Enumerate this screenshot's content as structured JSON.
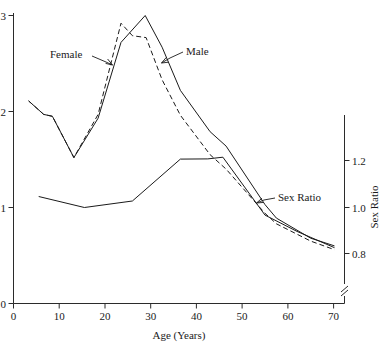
{
  "chart_data": {
    "type": "line",
    "title": "",
    "xlabel": "Age (Years)",
    "ylabel": "",
    "y2label": "Sex Ratio",
    "xlim": [
      0,
      73
    ],
    "ylim": [
      0,
      3.1
    ],
    "y2lim": [
      0.72,
      1.29
    ],
    "xticks": [
      0,
      10,
      20,
      30,
      40,
      50,
      60,
      70
    ],
    "xticklabels": [
      "0",
      "10",
      "20",
      "30",
      "40",
      "50",
      "60",
      "70"
    ],
    "yticks": [
      0,
      1,
      2,
      3
    ],
    "yticklabels": [
      "0",
      "1",
      "2",
      "3"
    ],
    "y2ticks": [
      0.8,
      1.0,
      1.2
    ],
    "y2ticklabels": [
      "0.8",
      "1.0",
      "1.2"
    ],
    "grid": false,
    "legend": "inline-annotations",
    "axis_break_right": true,
    "series": [
      {
        "name": "Male",
        "style": "solid",
        "axis": "left",
        "x": [
          3.3,
          6.6,
          8.5,
          13.2,
          18.5,
          23.5,
          28.8,
          32.5,
          36.5,
          43.0,
          46.5,
          55.0,
          57.5,
          65.0,
          70.2
        ],
        "y": [
          2.11,
          1.97,
          1.95,
          1.52,
          1.93,
          2.72,
          3.0,
          2.67,
          2.22,
          1.79,
          1.64,
          1.03,
          0.89,
          0.68,
          0.6
        ]
      },
      {
        "name": "Female",
        "style": "dashed",
        "axis": "left",
        "x": [
          3.3,
          6.6,
          8.5,
          13.2,
          18.5,
          23.5,
          26.0,
          29.0,
          32.5,
          36.5,
          43.0,
          46.5,
          55.0,
          57.5,
          65.0,
          70.2
        ],
        "y": [
          2.11,
          1.97,
          1.95,
          1.52,
          1.97,
          2.92,
          2.79,
          2.77,
          2.33,
          1.96,
          1.55,
          1.4,
          0.94,
          0.83,
          0.65,
          0.56
        ]
      },
      {
        "name": "Sex Ratio",
        "style": "solid",
        "axis": "right",
        "x": [
          5.5,
          15.5,
          26.0,
          36.5,
          42.5,
          45.8,
          55.0,
          62.0,
          70.2
        ],
        "y": [
          1.045,
          0.998,
          1.026,
          1.206,
          1.207,
          1.214,
          0.965,
          0.895,
          0.825
        ]
      }
    ],
    "annotations": [
      {
        "text": "Female",
        "x": 50,
        "y": 54
      },
      {
        "text": "Male",
        "x": 185,
        "y": 51
      },
      {
        "text": "Sex Ratio",
        "x": 277,
        "y": 197
      }
    ]
  },
  "axes": {
    "x_title": "Age (Years)",
    "y2_title": "Sex Ratio"
  },
  "labels": {
    "female": "Female",
    "male": "Male",
    "sex_ratio": "Sex Ratio"
  }
}
